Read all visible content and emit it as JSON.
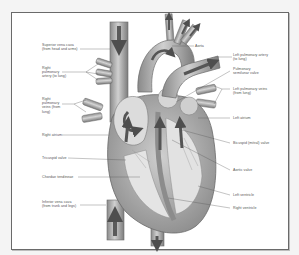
{
  "diagram": {
    "colors": {
      "frame": "#6a6a6a",
      "background": "#ffffff",
      "tissue": "#9a9a9a",
      "inner": "#d8d8d8",
      "arrow": "#5a5a5a",
      "label": "#555555"
    },
    "labels_left": [
      {
        "id": "superior-vena-cava",
        "text": "Superior vena cava\n(from head and arms)"
      },
      {
        "id": "right-pulmonary-artery",
        "text": "Right\npulmonary\nartery (to lung)"
      },
      {
        "id": "right-pulmonary-veins",
        "text": "Right\npulmonary\nveins (from\nlung)"
      },
      {
        "id": "right-atrium",
        "text": "Right atrium"
      },
      {
        "id": "tricuspid-valve",
        "text": "Tricuspid valve"
      },
      {
        "id": "chordae-tendineae",
        "text": "Chordae tendineae"
      },
      {
        "id": "inferior-vena-cava",
        "text": "Inferior vena cava\n(from trunk and legs)"
      }
    ],
    "labels_right": [
      {
        "id": "aorta",
        "text": "Aorta"
      },
      {
        "id": "left-pulmonary-artery",
        "text": "Left pulmonary artery\n(to lung)"
      },
      {
        "id": "pulmonary-semilunar-valve",
        "text": "Pulmonary\nsemilunar valve"
      },
      {
        "id": "left-pulmonary-veins",
        "text": "Left pulmonary veins\n(from lung)"
      },
      {
        "id": "left-atrium",
        "text": "Left atrium"
      },
      {
        "id": "bicuspid-mitral-valve",
        "text": "Bicuspid (mitral) valve"
      },
      {
        "id": "aortic-valve",
        "text": "Aortic valve"
      },
      {
        "id": "left-ventricle",
        "text": "Left ventricle"
      },
      {
        "id": "right-ventricle",
        "text": "Right ventricle"
      }
    ]
  }
}
